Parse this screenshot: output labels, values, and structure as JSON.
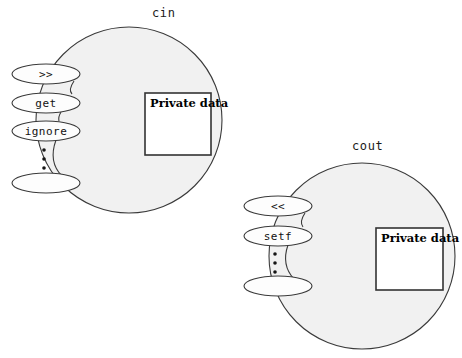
{
  "diagram": {
    "background_color": "#ffffff",
    "object_fill_color": "#f1f1f1",
    "object_stroke_color": "#3a3a3a",
    "member_fill_color": "#fdfdfd",
    "private_box_fill_color": "#ffffff",
    "private_box_stroke_color": "#333333"
  },
  "objects": [
    {
      "id": "cin",
      "label": "cin",
      "label_x": 152,
      "label_y": 17,
      "circle": {
        "cx": 129,
        "cy": 120,
        "r": 93
      },
      "private_box": {
        "label": "Private data",
        "x": 145,
        "y": 93,
        "width": 66,
        "height": 62,
        "text_x": 150,
        "text_y": 107
      },
      "members": [
        {
          "label": ">>",
          "cx": 46,
          "cy": 74,
          "rx": 34,
          "ry": 10
        },
        {
          "label": "get",
          "cx": 46,
          "cy": 103,
          "rx": 34,
          "ry": 10
        },
        {
          "label": "ignore",
          "cx": 46,
          "cy": 131,
          "rx": 34,
          "ry": 10
        },
        {
          "label": "",
          "cx": 46,
          "cy": 183,
          "rx": 34,
          "ry": 10
        }
      ],
      "ellipsis_dots": [
        {
          "cx": 44,
          "cy": 150,
          "r": 1.8
        },
        {
          "cx": 44,
          "cy": 159,
          "r": 1.8
        },
        {
          "cx": 44,
          "cy": 168,
          "r": 1.8
        }
      ]
    },
    {
      "id": "cout",
      "label": "cout",
      "label_x": 352,
      "label_y": 150,
      "circle": {
        "cx": 362,
        "cy": 256,
        "r": 93
      },
      "private_box": {
        "label": "Private data",
        "x": 376,
        "y": 228,
        "width": 67,
        "height": 62,
        "text_x": 381,
        "text_y": 242
      },
      "members": [
        {
          "label": "<<",
          "cx": 278,
          "cy": 206,
          "rx": 34,
          "ry": 10
        },
        {
          "label": "setf",
          "cx": 278,
          "cy": 236,
          "rx": 34,
          "ry": 10
        },
        {
          "label": "",
          "cx": 278,
          "cy": 286,
          "rx": 34,
          "ry": 10
        }
      ],
      "ellipsis_dots": [
        {
          "cx": 275,
          "cy": 254,
          "r": 1.8
        },
        {
          "cx": 275,
          "cy": 263,
          "r": 1.8
        },
        {
          "cx": 275,
          "cy": 272,
          "r": 1.8
        }
      ]
    }
  ]
}
